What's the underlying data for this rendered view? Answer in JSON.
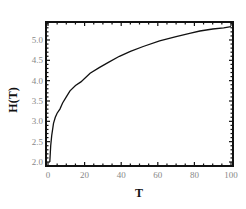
{
  "chart_data": {
    "type": "line",
    "title": "",
    "xlabel": "T",
    "ylabel": "H(T)",
    "xlim": [
      -1,
      101
    ],
    "ylim": [
      1.97,
      5.44
    ],
    "grid": false,
    "legend": null,
    "x_ticks": [
      0,
      20,
      40,
      60,
      80,
      100
    ],
    "x_tick_labels": [
      "0",
      "20",
      "40",
      "60",
      "80",
      "100"
    ],
    "y_ticks": [
      2.0,
      2.5,
      3.0,
      3.5,
      4.0,
      4.5,
      5.0
    ],
    "y_tick_labels": [
      "2.0",
      "2.5",
      "3.0",
      "3.5",
      "4.0",
      "4.5",
      "5.0"
    ],
    "series": [
      {
        "name": "H(T)",
        "color": "#111111",
        "x": [
          1,
          1.5,
          2,
          3,
          4,
          5,
          6.5,
          8,
          10,
          12,
          15,
          18,
          23,
          28,
          33,
          39,
          45,
          52,
          61,
          70,
          78,
          83,
          90,
          96,
          100
        ],
        "y": [
          2.0,
          2.4,
          2.65,
          2.95,
          3.1,
          3.2,
          3.3,
          3.45,
          3.6,
          3.75,
          3.88,
          3.97,
          4.18,
          4.32,
          4.45,
          4.6,
          4.72,
          4.84,
          4.98,
          5.08,
          5.17,
          5.22,
          5.27,
          5.3,
          5.33
        ]
      }
    ]
  }
}
